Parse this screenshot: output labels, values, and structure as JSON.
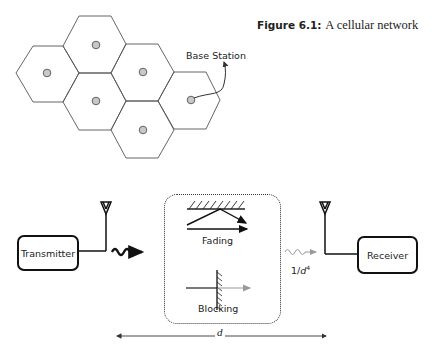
{
  "figure": {
    "label": "Figure 6.1:",
    "caption": "A cellular network"
  },
  "cellular_network": {
    "cell_count": 6,
    "annotation": "Base Station",
    "colors": {
      "cell_stroke": "#555555",
      "base_station_fill": "#c8c8c8",
      "base_station_stroke": "#555555"
    }
  },
  "link_diagram": {
    "transmitter_label": "Transmitter",
    "receiver_label": "Receiver",
    "fading_label": "Fading",
    "blocking_label": "Blocking",
    "path_loss_label_base": "1/",
    "path_loss_label_var": "d",
    "path_loss_label_exp": "4",
    "distance_label": "d"
  }
}
